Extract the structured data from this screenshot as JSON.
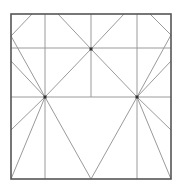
{
  "diagram": {
    "colors": {
      "background": "#ffffff",
      "frame": "#555555",
      "line": "#9a9a9a",
      "node": "#333333"
    },
    "frame": {
      "x1": 11,
      "y1": 14,
      "x2": 171,
      "y2": 179
    },
    "nodes": [
      {
        "id": "top-node",
        "x": 91,
        "y": 49
      },
      {
        "id": "left-node",
        "x": 45,
        "y": 97
      },
      {
        "id": "right-node",
        "x": 137,
        "y": 97
      }
    ],
    "lines": [
      {
        "name": "vertical-left",
        "x1": 45,
        "y1": 14,
        "x2": 45,
        "y2": 179
      },
      {
        "name": "vertical-right",
        "x1": 137,
        "y1": 14,
        "x2": 137,
        "y2": 179
      },
      {
        "name": "vertical-center",
        "x1": 91,
        "y1": 14,
        "x2": 91,
        "y2": 97
      },
      {
        "name": "horizontal-upper",
        "x1": 11,
        "y1": 48,
        "x2": 171,
        "y2": 48
      },
      {
        "name": "horizontal-middle",
        "x1": 11,
        "y1": 97,
        "x2": 171,
        "y2": 97
      },
      {
        "name": "top-left-corner-cut",
        "x1": 32,
        "y1": 14,
        "x2": 11,
        "y2": 36
      },
      {
        "name": "top-right-corner-cut",
        "x1": 150,
        "y1": 14,
        "x2": 171,
        "y2": 35
      },
      {
        "name": "left-upper-diagonal",
        "x1": 11,
        "y1": 36,
        "x2": 45,
        "y2": 97
      },
      {
        "name": "left-mid-diagonal",
        "x1": 11,
        "y1": 61,
        "x2": 45,
        "y2": 97
      },
      {
        "name": "left-lower-diagonal",
        "x1": 45,
        "y1": 97,
        "x2": 11,
        "y2": 130
      },
      {
        "name": "left-corner-diagonal",
        "x1": 45,
        "y1": 97,
        "x2": 11,
        "y2": 179
      },
      {
        "name": "right-upper-diagonal",
        "x1": 171,
        "y1": 35,
        "x2": 137,
        "y2": 97
      },
      {
        "name": "right-mid-diagonal",
        "x1": 171,
        "y1": 61,
        "x2": 137,
        "y2": 97
      },
      {
        "name": "right-lower-diagonal",
        "x1": 137,
        "y1": 97,
        "x2": 171,
        "y2": 130
      },
      {
        "name": "right-corner-diagonal",
        "x1": 137,
        "y1": 97,
        "x2": 171,
        "y2": 179
      },
      {
        "name": "top-left-to-top-node",
        "x1": 58,
        "y1": 14,
        "x2": 91,
        "y2": 49
      },
      {
        "name": "top-right-to-top-node",
        "x1": 124,
        "y1": 14,
        "x2": 91,
        "y2": 49
      },
      {
        "name": "top-node-to-left-node",
        "x1": 91,
        "y1": 49,
        "x2": 45,
        "y2": 97
      },
      {
        "name": "top-node-to-right-node",
        "x1": 91,
        "y1": 49,
        "x2": 137,
        "y2": 97
      },
      {
        "name": "v-left-arm",
        "x1": 45,
        "y1": 97,
        "x2": 91,
        "y2": 179
      },
      {
        "name": "v-right-arm",
        "x1": 137,
        "y1": 97,
        "x2": 91,
        "y2": 179
      }
    ]
  }
}
